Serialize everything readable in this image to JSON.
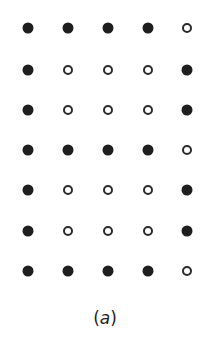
{
  "figure": {
    "caption_open": "(",
    "caption_letter": "a",
    "caption_close": ")",
    "columns_x": [
      28,
      68,
      108,
      148,
      187
    ],
    "rows_y": [
      28,
      70,
      110,
      150,
      190,
      231,
      271
    ],
    "colors": {
      "filled": "#1e1e1e",
      "open_stroke": "#2a2a2a",
      "background": "#ffffff"
    },
    "grid": [
      [
        "filled",
        "filled",
        "filled",
        "filled",
        "open"
      ],
      [
        "filled",
        "open",
        "open",
        "open",
        "filled"
      ],
      [
        "filled",
        "open",
        "open",
        "open",
        "filled"
      ],
      [
        "filled",
        "filled",
        "filled",
        "filled",
        "open"
      ],
      [
        "filled",
        "open",
        "open",
        "open",
        "filled"
      ],
      [
        "filled",
        "open",
        "open",
        "open",
        "filled"
      ],
      [
        "filled",
        "filled",
        "filled",
        "filled",
        "open"
      ]
    ]
  }
}
